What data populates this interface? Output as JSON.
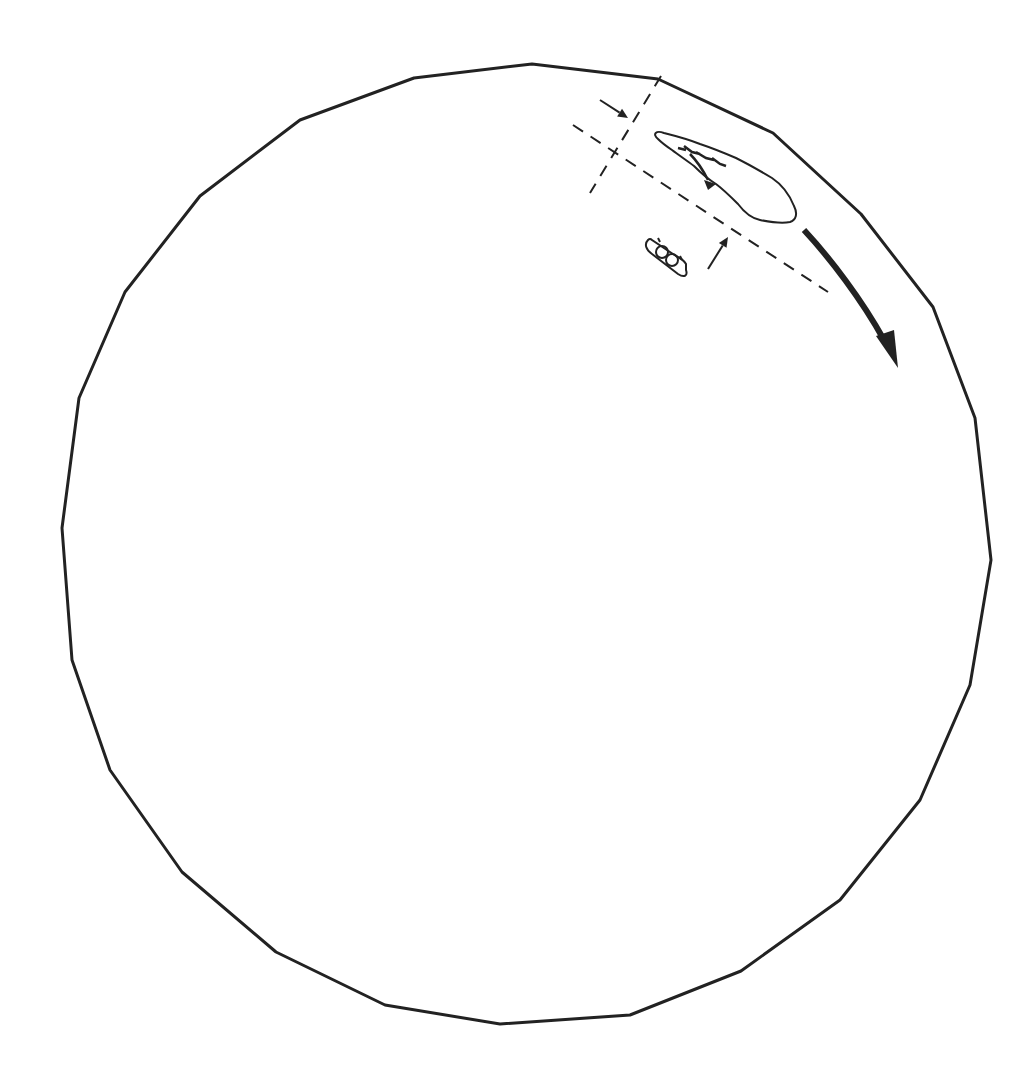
{
  "canvas": {
    "width": 1019,
    "height": 1089,
    "background": "#ffffff"
  },
  "colors": {
    "stroke": "#222222",
    "fill": "#222222"
  },
  "outline": {
    "name": "circular-boundary",
    "stroke_width": 3,
    "points": [
      [
        532,
        64
      ],
      [
        658,
        79
      ],
      [
        773,
        133
      ],
      [
        861,
        214
      ],
      [
        933,
        307
      ],
      [
        975,
        418
      ],
      [
        991,
        560
      ],
      [
        970,
        685
      ],
      [
        920,
        800
      ],
      [
        840,
        900
      ],
      [
        741,
        971
      ],
      [
        630,
        1015
      ],
      [
        500,
        1024
      ],
      [
        385,
        1005
      ],
      [
        276,
        952
      ],
      [
        182,
        872
      ],
      [
        110,
        770
      ],
      [
        72,
        660
      ],
      [
        62,
        528
      ],
      [
        79,
        398
      ],
      [
        125,
        292
      ],
      [
        200,
        196
      ],
      [
        300,
        120
      ],
      [
        414,
        78
      ]
    ]
  },
  "dashed_lines": [
    {
      "name": "dashed-line-transverse",
      "x1": 661,
      "y1": 76,
      "x2": 590,
      "y2": 193
    },
    {
      "name": "dashed-line-longitudinal",
      "x1": 573,
      "y1": 125,
      "x2": 828,
      "y2": 292
    }
  ],
  "small_arrows": [
    {
      "name": "arrow-inward-upper",
      "x1": 600,
      "y1": 100,
      "x2": 628,
      "y2": 118
    },
    {
      "name": "arrow-inward-lower",
      "x1": 708,
      "y1": 269,
      "x2": 728,
      "y2": 237
    }
  ],
  "elongated_shape": {
    "name": "elongated-outline",
    "path": "M658,139 C652,134 656,130 664,133 C676,136 690,140 700,144 C712,148 722,152 736,158 C752,166 762,172 772,178 C784,186 790,196 794,206 C798,214 796,220 790,222 C780,224 770,222 760,220 C750,218 744,212 738,204 C730,196 724,190 716,184 C706,178 700,172 694,166 C686,160 680,156 672,150 C666,146 662,143 658,139 Z"
  },
  "inner_marks": {
    "name": "squiggle-marks",
    "path": "M678,148 L686,150 M684,146 L692,152 L700,154 M696,152 L706,158 L714,160 M712,158 L720,164 L726,166 M690,154 C696,160 702,168 708,180",
    "head": [
      [
        704,
        180
      ],
      [
        716,
        184
      ],
      [
        708,
        190
      ]
    ]
  },
  "small_object": {
    "name": "capsule-object",
    "outer_path": "M648,240 C644,244 646,250 652,254 L678,274 C684,278 688,276 686,270 L686,264 C684,260 680,258 676,256 L652,240 C650,238 649,239 648,240 Z",
    "circles": [
      [
        662,
        252,
        6
      ],
      [
        672,
        260,
        6
      ]
    ],
    "ticks": [
      [
        658,
        238,
        660,
        242
      ],
      [
        680,
        256,
        682,
        260
      ]
    ]
  },
  "large_arrow": {
    "name": "rotation-direction-arrow",
    "path": "M804,230 C830,258 862,300 884,340",
    "stroke_width": 6,
    "head": [
      [
        876,
        336
      ],
      [
        898,
        368
      ],
      [
        894,
        330
      ]
    ]
  }
}
